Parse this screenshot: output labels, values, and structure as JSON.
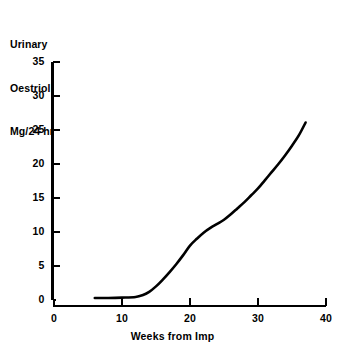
{
  "chart_data": {
    "type": "line",
    "title": "",
    "ylabel_lines": [
      "Urinary",
      "Oestriol",
      "Mg/24 hr"
    ],
    "xlabel": "Weeks from Imp",
    "xlim": [
      0,
      40
    ],
    "ylim": [
      0,
      35
    ],
    "xticks": [
      0,
      10,
      20,
      30,
      40
    ],
    "xtick_labels": [
      "0",
      "10",
      "20",
      "30",
      "40"
    ],
    "yticks": [
      0,
      5,
      10,
      15,
      20,
      25,
      30,
      35
    ],
    "ytick_labels": [
      "0",
      "5",
      "10",
      "15",
      "20",
      "25",
      "30",
      "35"
    ],
    "grid": false,
    "legend": "none",
    "series": [
      {
        "name": "Urinary Oestriol",
        "color": "#000000",
        "x": [
          6.0,
          8.0,
          10.0,
          12.0,
          13.0,
          14.0,
          15.0,
          16.0,
          17.0,
          18.0,
          19.0,
          20.0,
          21.0,
          22.0,
          23.0,
          24.0,
          25.0,
          26.0,
          27.0,
          28.0,
          29.0,
          30.0,
          31.0,
          32.0,
          33.0,
          34.0,
          35.0,
          36.0,
          37.0
        ],
        "y": [
          0.3,
          0.3,
          0.35,
          0.45,
          0.7,
          1.2,
          2.0,
          3.0,
          4.1,
          5.3,
          6.6,
          8.0,
          9.0,
          9.9,
          10.6,
          11.2,
          11.8,
          12.6,
          13.5,
          14.4,
          15.4,
          16.4,
          17.6,
          18.8,
          20.0,
          21.3,
          22.7,
          24.2,
          26.1
        ]
      }
    ]
  },
  "axes": {
    "x_tick_color": "#000000",
    "y_tick_color": "#000000",
    "spine_color": "#000000"
  }
}
